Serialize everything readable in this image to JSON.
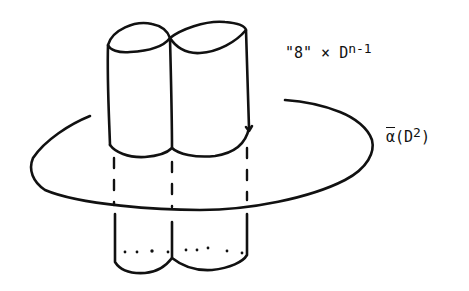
{
  "diagram": {
    "labels": {
      "product": {
        "prefix": "\"8\" × D",
        "exponent": "n-1"
      },
      "disk": {
        "symbol": "α",
        "open": "(D",
        "exponent": "2",
        "close": ")"
      }
    },
    "elements": [
      "figure-eight-cylinder-top",
      "figure-eight-cylinder-bottom",
      "disk-ellipse",
      "hidden-dashed-lines"
    ],
    "colors": {
      "ink": "#111111",
      "background": "#ffffff"
    }
  }
}
